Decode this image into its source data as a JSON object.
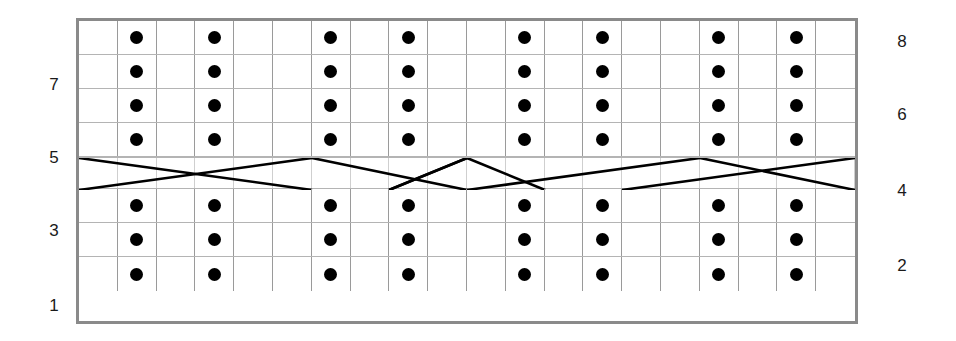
{
  "chart_data": {
    "type": "table",
    "columns": 20,
    "rows": 8,
    "grid": true,
    "legend": [],
    "row_labels_left": [
      "7",
      "5",
      "3",
      "1"
    ],
    "row_labels_right": [
      "8",
      "6",
      "4",
      "2"
    ],
    "dot_columns": [
      1,
      3,
      6,
      8,
      11,
      13,
      16,
      18
    ],
    "rows_detail": [
      {
        "number": 8,
        "label_side": "right",
        "label": "8",
        "type": "dots",
        "dot_columns": [
          1,
          3,
          6,
          8,
          11,
          13,
          16,
          18
        ]
      },
      {
        "number": 7,
        "label_side": "left",
        "label": "7",
        "type": "dots",
        "dot_columns": [
          1,
          3,
          6,
          8,
          11,
          13,
          16,
          18
        ]
      },
      {
        "number": 6,
        "label_side": "right",
        "label": "6",
        "type": "dots",
        "dot_columns": [
          1,
          3,
          6,
          8,
          11,
          13,
          16,
          18
        ]
      },
      {
        "number": 5,
        "label_side": "left",
        "label": "5",
        "type": "dots",
        "dot_columns": [
          1,
          3,
          6,
          8,
          11,
          13,
          16,
          18
        ]
      },
      {
        "number": 4,
        "label_side": "right",
        "label": "4",
        "type": "cable",
        "dot_columns": []
      },
      {
        "number": 3,
        "label_side": "left",
        "label": "3",
        "type": "dots",
        "dot_columns": [
          1,
          3,
          6,
          8,
          11,
          13,
          16,
          18
        ]
      },
      {
        "number": 2,
        "label_side": "right",
        "label": "2",
        "type": "dots",
        "dot_columns": [
          1,
          3,
          6,
          8,
          11,
          13,
          16,
          18
        ]
      },
      {
        "number": 1,
        "label_side": "left",
        "label": "1",
        "type": "dots",
        "dot_columns": [
          1,
          3,
          6,
          8,
          11,
          13,
          16,
          18
        ]
      }
    ],
    "cable_row": {
      "row_number": 4,
      "segments": [
        {
          "name": "cross-left-a",
          "x1": 0,
          "y1": 0,
          "x2": 233,
          "y2": 32
        },
        {
          "name": "cross-left-b",
          "x1": 0,
          "y1": 32,
          "x2": 233,
          "y2": 0
        },
        {
          "name": "diamond-1-up",
          "x1": 233,
          "y1": 0,
          "x2": 388,
          "y2": 32
        },
        {
          "name": "diamond-1-dn",
          "x1": 310,
          "y1": 32,
          "x2": 388,
          "y2": 0
        },
        {
          "name": "diamond-2-up",
          "x1": 310,
          "y1": 32,
          "x2": 388,
          "y2": 0
        },
        {
          "name": "diamond-2-dn",
          "x1": 388,
          "y1": 0,
          "x2": 466,
          "y2": 32
        },
        {
          "name": "cross-right-a",
          "x1": 388,
          "y1": 32,
          "x2": 621,
          "y2": 0
        },
        {
          "name": "cross-right-b",
          "x1": 543,
          "y1": 32,
          "x2": 776,
          "y2": 0
        },
        {
          "name": "cross-right-c",
          "x1": 621,
          "y1": 0,
          "x2": 776,
          "y2": 32
        }
      ]
    },
    "colors": {
      "border": "#8a8a8a",
      "gridline": "#9a9a9a",
      "gridline_light": "#b4b4b4",
      "symbol": "#000000",
      "cable_line": "#000000",
      "background": "#ffffff",
      "label_text": "#1a1a1a"
    },
    "symbols": {
      "dot": "purl-stitch-dot",
      "cable": "cable-cross"
    }
  }
}
